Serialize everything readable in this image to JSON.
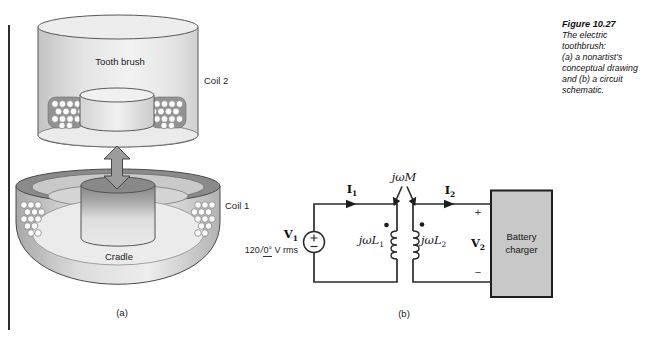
{
  "figure": {
    "caption_title": "Figure 10.27",
    "caption_lines": [
      "The electric",
      "toothbrush:",
      "(a) a nonartist's",
      "conceptual drawing",
      "and (b) a circuit",
      "schematic."
    ]
  },
  "drawing_a": {
    "tooth_brush_label": "Tooth brush",
    "coil2_label": "Coil 2",
    "coil1_label": "Coil 1",
    "cradle_label": "Cradle",
    "panel_label": "(a)"
  },
  "circuit_b": {
    "panel_label": "(b)",
    "v1": {
      "base": "V",
      "sub": "1"
    },
    "source_value": {
      "magnitude": "120",
      "slash": "/",
      "angle": "0°",
      "unit": " V rms"
    },
    "i1": {
      "base": "I",
      "sub": "1"
    },
    "i2": {
      "base": "I",
      "sub": "2"
    },
    "mutual_label": "jωM",
    "l1": {
      "base": "jωL",
      "sub": "1"
    },
    "l2": {
      "base": "jωL",
      "sub": "2"
    },
    "v2": {
      "base": "V",
      "sub": "2"
    },
    "v2_plus": "+",
    "v2_minus": "−",
    "battery_line1": "Battery",
    "battery_line2": "charger"
  },
  "colors": {
    "wire": "#2b2b2b",
    "battery_box_fill": "#c8c8c8",
    "rim_gray": "#8a8a8a",
    "winding_bg": "#929292",
    "arrow_gray": "#9c9c9c",
    "page_bg": "#ffffff"
  }
}
